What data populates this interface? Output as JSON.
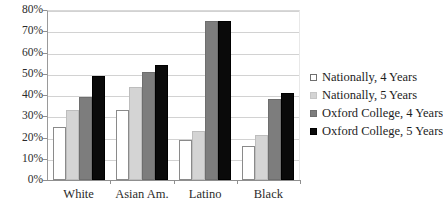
{
  "chart_data": {
    "type": "bar",
    "title": "",
    "subtitle": "",
    "xlabel": "",
    "ylabel": "",
    "ylim": [
      0,
      80
    ],
    "y_tick_labels": [
      "0%",
      "10%",
      "20%",
      "30%",
      "40%",
      "50%",
      "60%",
      "70%",
      "80%"
    ],
    "y_tick_values": [
      0,
      10,
      20,
      30,
      40,
      50,
      60,
      70,
      80
    ],
    "grid": true,
    "legend_position": "right",
    "categories": [
      "White",
      "Asian Am.",
      "Latino",
      "Black"
    ],
    "series": [
      {
        "name": "Nationally, 4 Years",
        "color": "#ffffff",
        "values": [
          25,
          33,
          19,
          16
        ]
      },
      {
        "name": "Nationally, 5 Years",
        "color": "#d4d4d4",
        "values": [
          33,
          44,
          23,
          21
        ]
      },
      {
        "name": "Oxford College, 4 Years",
        "color": "#7d7d7d",
        "values": [
          39,
          51,
          75,
          38
        ]
      },
      {
        "name": "Oxford College, 5 Years",
        "color": "#0a0a0a",
        "values": [
          49,
          54,
          75,
          41
        ]
      }
    ]
  }
}
